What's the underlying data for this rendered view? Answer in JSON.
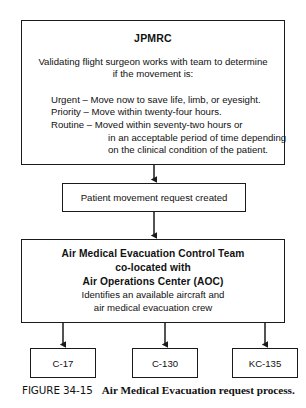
{
  "figure": {
    "label": "FIGURE 34-15",
    "title": "Air Medical Evacuation request process."
  },
  "nodes": {
    "jpmrc": {
      "title": "JPMRC",
      "intro_line1": "Validating flight surgeon works with team to determine",
      "intro_line2": "if the movement is:",
      "urgency": [
        "Urgent – Move now to save life, limb, or eyesight.",
        "Priority – Move within twenty-four hours.",
        "Routine – Moved within seventy-two hours or",
        "in an acceptable period of time depending",
        "on the clinical condition of the patient."
      ]
    },
    "request": {
      "label": "Patient movement request created"
    },
    "amect": {
      "line1": "Air Medical Evacuation Control Team",
      "line2": "co-located with",
      "line3": "Air Operations Center (AOC)",
      "line4": "Identifies an available aircraft and",
      "line5": "air medical evacuation crew"
    },
    "aircraft": [
      {
        "label": "C-17"
      },
      {
        "label": "C-130"
      },
      {
        "label": "KC-135"
      }
    ]
  },
  "style": {
    "line_color": "#1a1a1a",
    "background": "#ffffff",
    "text_color": "#111111"
  }
}
